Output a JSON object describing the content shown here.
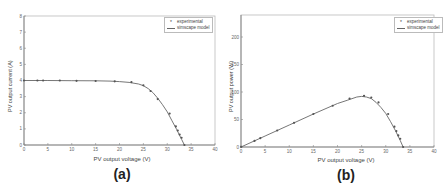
{
  "chart_data": [
    {
      "type": "line",
      "panel": "(a)",
      "title": "",
      "xlabel": "PV output voltage (V)",
      "ylabel": "PV output current (A)",
      "xlim": [
        0,
        40
      ],
      "ylim": [
        0,
        8
      ],
      "xticks": [
        0,
        5,
        10,
        15,
        20,
        25,
        30,
        35,
        40
      ],
      "yticks": [
        0,
        1,
        2,
        3,
        4,
        5,
        6,
        7,
        8
      ],
      "grid": false,
      "legend": {
        "position": "top-right",
        "entries": [
          "experimental",
          "simscape model"
        ]
      },
      "series": [
        {
          "name": "experimental",
          "style": "markers",
          "x": [
            0,
            2.8,
            4,
            7.5,
            11,
            15,
            19,
            22.5,
            25,
            26.5,
            28,
            30.5,
            31.8,
            32.2,
            32.6,
            33,
            33.6
          ],
          "y": [
            4.0,
            4.0,
            4.0,
            4.0,
            3.98,
            3.97,
            3.95,
            3.9,
            3.7,
            3.35,
            2.85,
            1.95,
            1.15,
            0.9,
            0.65,
            0.45,
            0
          ]
        },
        {
          "name": "simscape model",
          "style": "line",
          "x": [
            0,
            5,
            10,
            15,
            18,
            20,
            22,
            24,
            25,
            26,
            27,
            28,
            29,
            30,
            31,
            32,
            33,
            33.6
          ],
          "y": [
            4.0,
            4.0,
            3.99,
            3.98,
            3.96,
            3.93,
            3.88,
            3.78,
            3.68,
            3.5,
            3.25,
            2.9,
            2.5,
            2.05,
            1.5,
            0.95,
            0.35,
            0
          ]
        }
      ]
    },
    {
      "type": "line",
      "panel": "(b)",
      "title": "",
      "xlabel": "PV output voltage (V)",
      "ylabel": "PV output power (W)",
      "xlim": [
        0,
        40
      ],
      "ylim": [
        0,
        240
      ],
      "xticks": [
        0,
        5,
        10,
        15,
        20,
        25,
        30,
        35,
        40
      ],
      "yticks": [
        0,
        50,
        100,
        150,
        200
      ],
      "grid": false,
      "legend": {
        "position": "top-right",
        "entries": [
          "experimental",
          "simscape model"
        ]
      },
      "series": [
        {
          "name": "experimental",
          "style": "markers",
          "x": [
            0,
            2.8,
            4,
            7.5,
            11,
            15,
            19,
            22.5,
            25.5,
            27,
            28.5,
            30.5,
            31.8,
            32.2,
            32.6,
            33,
            33.6
          ],
          "y": [
            0,
            11,
            16,
            30,
            44,
            60,
            75,
            88,
            93,
            90,
            81,
            60,
            37,
            29,
            21,
            15,
            0
          ]
        },
        {
          "name": "simscape model",
          "style": "line",
          "x": [
            0,
            5,
            10,
            15,
            20,
            22,
            24,
            25,
            26,
            27,
            28,
            29,
            30,
            31,
            32,
            33,
            33.6
          ],
          "y": [
            0,
            20,
            40,
            60,
            79,
            85,
            91,
            92,
            91,
            88,
            81,
            72,
            61,
            46,
            30,
            12,
            0
          ]
        }
      ]
    }
  ],
  "panels": {
    "a": {
      "caption": "(a)",
      "xlabel": "PV output voltage (V)",
      "ylabel": "PV output current (A)",
      "legend_marker": "experimental",
      "legend_line": "simscape model"
    },
    "b": {
      "caption": "(b)",
      "xlabel": "PV output voltage (V)",
      "ylabel": "PV output power (W)",
      "legend_marker": "experimental",
      "legend_line": "simscape model"
    }
  },
  "colors": {
    "curve": "#666666",
    "marker": "#555555",
    "axis": "#888888",
    "frame": "#bbbbbb"
  }
}
